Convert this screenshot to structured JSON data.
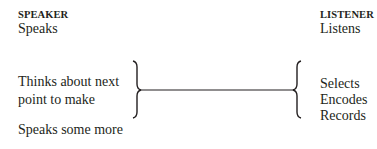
{
  "speaker": {
    "header": "SPEAKER",
    "items": [
      "Speaks",
      "Thinks about next",
      "point to make",
      "Speaks some more"
    ]
  },
  "listener": {
    "header": "LISTENER",
    "items": [
      "Listens",
      "Selects",
      "Encodes",
      "Records"
    ]
  },
  "colors": {
    "text": "#231f20",
    "line": "#231f20"
  }
}
